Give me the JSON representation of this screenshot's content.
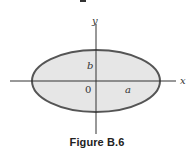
{
  "figure": {
    "caption": "Figure B.6",
    "labels": {
      "y_axis": "y",
      "x_axis": "x",
      "semi_minor": "b",
      "semi_major": "a",
      "origin": "0"
    },
    "shape": {
      "type": "ellipse",
      "description": "Ellipse centered at origin with semi-major axis a along x and semi-minor axis b along y",
      "fill_color": "#e6e6e6",
      "stroke_color": "#555555"
    },
    "axes": {
      "color": "#333333"
    }
  }
}
